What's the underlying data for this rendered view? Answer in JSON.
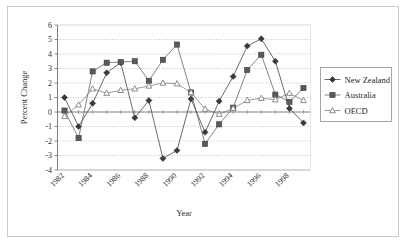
{
  "chart_data": {
    "type": "line",
    "title": "",
    "xlabel": "Year",
    "ylabel": "Percent Change",
    "x": [
      1982,
      1983,
      1984,
      1985,
      1986,
      1987,
      1988,
      1989,
      1990,
      1991,
      1992,
      1993,
      1994,
      1995,
      1996,
      1997,
      1998,
      1999
    ],
    "xtick_labels": [
      "1982",
      "1984",
      "1986",
      "1988",
      "1990",
      "1992",
      "1994",
      "1996",
      "1998"
    ],
    "xtick_values": [
      1982,
      1984,
      1986,
      1988,
      1990,
      1992,
      1994,
      1996,
      1998
    ],
    "ytick_labels": [
      "-4",
      "-3",
      "-2",
      "-1",
      "0",
      "1",
      "2",
      "3",
      "4",
      "5",
      "6"
    ],
    "ytick_values": [
      -4,
      -3,
      -2,
      -1,
      0,
      1,
      2,
      3,
      4,
      5,
      6
    ],
    "ylim": [
      -4,
      6
    ],
    "xlim": [
      1981.5,
      1999.5
    ],
    "grid": "horizontal-dotted",
    "legend_position": "right",
    "series": [
      {
        "name": "New Zealand",
        "marker": "filled-diamond",
        "color": "#3a3a3a",
        "values": [
          1.0,
          -1.0,
          0.6,
          2.7,
          3.4,
          -0.4,
          0.8,
          -3.2,
          -2.65,
          0.9,
          -1.4,
          0.75,
          2.45,
          4.55,
          5.05,
          3.5,
          0.25,
          -0.75
        ]
      },
      {
        "name": "Australia",
        "marker": "filled-square",
        "color": "#5a5a5a",
        "values": [
          0.1,
          -1.8,
          2.8,
          3.4,
          3.45,
          3.5,
          2.15,
          3.6,
          4.65,
          1.35,
          -2.2,
          -0.85,
          0.3,
          2.9,
          3.95,
          1.2,
          0.7,
          1.65
        ]
      },
      {
        "name": "OECD",
        "marker": "open-triangle",
        "color": "#7a7a7a",
        "values": [
          -0.3,
          0.5,
          1.6,
          1.3,
          1.5,
          1.6,
          1.8,
          2.0,
          1.95,
          1.35,
          0.2,
          -0.15,
          0.25,
          0.8,
          0.95,
          0.85,
          1.3,
          0.8
        ]
      }
    ]
  },
  "legend": {
    "items": [
      {
        "label": "New Zealand"
      },
      {
        "label": "Australia"
      },
      {
        "label": "OECD"
      }
    ]
  }
}
